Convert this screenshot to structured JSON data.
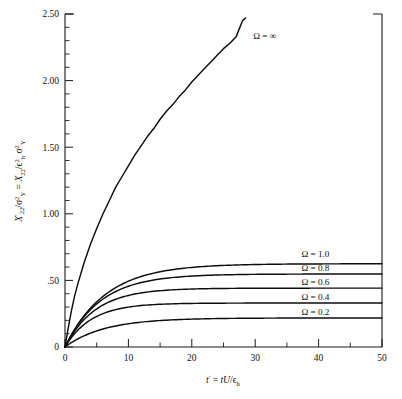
{
  "chart_data": {
    "type": "line",
    "title": "",
    "xlabel": "t' = tU/ε_h",
    "ylabel": "X'22/σ²Y = X22/ε²h σ²Y",
    "xlim": [
      0,
      50
    ],
    "ylim": [
      0,
      2.5
    ],
    "grid": false,
    "legend_position": "inline-right",
    "x_ticks": [
      0,
      10,
      20,
      30,
      40,
      50
    ],
    "x_tick_labels": [
      "0",
      "10",
      "20",
      "30",
      "40",
      "50"
    ],
    "x_minor_ticks": [
      5,
      15,
      25,
      35,
      45
    ],
    "y_ticks": [
      0,
      0.5,
      1.0,
      1.5,
      2.0,
      2.5
    ],
    "y_tick_labels": [
      "0",
      ".50",
      "1.00",
      "1.50",
      "2.00",
      "2.50"
    ],
    "y_minor_ticks": [
      0.1,
      0.2,
      0.3,
      0.4,
      0.6,
      0.7,
      0.8,
      0.9,
      1.1,
      1.2,
      1.3,
      1.4,
      1.6,
      1.7,
      1.8,
      1.9,
      2.1,
      2.2,
      2.3,
      2.4
    ],
    "series": [
      {
        "name": "Ω = ∞",
        "label": "Ω = ∞",
        "omega": "infinity",
        "plateau": null,
        "x_end": 28.5,
        "y_end": 2.47,
        "label_x": 31.5,
        "label_y": 2.34,
        "x": [
          0,
          0.5,
          1,
          1.5,
          2,
          3,
          4,
          5,
          6,
          7,
          8,
          9,
          10,
          11,
          12,
          13,
          14,
          15,
          16,
          17,
          18,
          19,
          20,
          21,
          22,
          23,
          24,
          25,
          26,
          27,
          28,
          28.5
        ],
        "values": [
          0,
          0.14,
          0.27,
          0.38,
          0.47,
          0.63,
          0.77,
          0.89,
          1.0,
          1.1,
          1.2,
          1.28,
          1.36,
          1.44,
          1.51,
          1.58,
          1.64,
          1.71,
          1.77,
          1.82,
          1.88,
          1.93,
          1.99,
          2.04,
          2.09,
          2.14,
          2.19,
          2.24,
          2.28,
          2.33,
          2.45,
          2.47
        ]
      },
      {
        "name": "Ω = 1.0",
        "label": "Ω = 1.0",
        "omega": 1.0,
        "plateau": 0.625,
        "tau": 6.4,
        "label_x": 39.5,
        "label_y": 0.7
      },
      {
        "name": "Ω = 0.8",
        "label": "Ω = 0.8",
        "omega": 0.8,
        "plateau": 0.548,
        "tau": 5.6,
        "label_x": 39.5,
        "label_y": 0.594
      },
      {
        "name": "Ω = 0.6",
        "label": "Ω = 0.6",
        "omega": 0.6,
        "plateau": 0.442,
        "tau": 4.8,
        "label_x": 39.5,
        "label_y": 0.487
      },
      {
        "name": "Ω = 0.4",
        "label": "Ω = 0.4",
        "omega": 0.4,
        "plateau": 0.33,
        "tau": 4.2,
        "label_x": 39.5,
        "label_y": 0.376
      },
      {
        "name": "Ω = 0.2",
        "label": "Ω = 0.2",
        "omega": 0.2,
        "plateau": 0.218,
        "tau": 6.2,
        "label_x": 39.5,
        "label_y": 0.266
      }
    ]
  },
  "axis_titles": {
    "x": {
      "var": "t",
      "prime": "′",
      "equals": " = ",
      "num": "tU",
      "slash": "/",
      "eps": "ϵ",
      "eps_sub": "h"
    },
    "y": {
      "x_var": "X",
      "x_sub": "22",
      "x_prime": "′",
      "sigma": "σ",
      "sigma_sup": "2",
      "sigma_sub": "Y",
      "equals": "=",
      "eps": "ϵ",
      "eps_sup": "2",
      "eps_sub": "h"
    }
  },
  "figure": {
    "background_color": "#ffffff",
    "line_color": "#0d0d0d",
    "axis_color": "#1a1a1a"
  }
}
